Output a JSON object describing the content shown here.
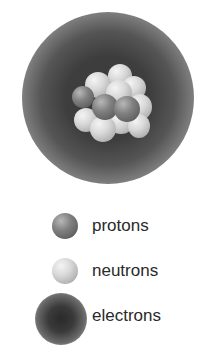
{
  "diagram": {
    "title": "",
    "atom": {
      "electron_cloud": "electron-cloud",
      "nucleus": {
        "protons_visible": 3,
        "neutrons_visible": 11
      }
    },
    "legend": [
      {
        "label": "protons",
        "icon": "proton-sphere-icon",
        "color": "#6e6e6e"
      },
      {
        "label": "neutrons",
        "icon": "neutron-sphere-icon",
        "color": "#c8c8c8"
      },
      {
        "label": "electrons",
        "icon": "electron-cloud-icon",
        "color": "#3a3a3a"
      }
    ]
  }
}
